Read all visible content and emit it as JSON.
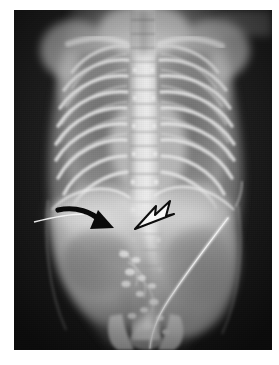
{
  "page": {
    "background_color": "#ffffff",
    "width": 279,
    "height": 365
  },
  "image": {
    "kind": "radiograph",
    "modality": "X-ray",
    "projection": "AP (anteroposterior)",
    "subject": "neonate / infant babygram",
    "region": "chest and abdomen",
    "orientation_note": "patient left on image right",
    "film": {
      "left": 14,
      "top": 10,
      "width": 258,
      "height": 340,
      "base_color": "#1d1d1d",
      "border_color": "#ffffff",
      "corner_patch": {
        "name": "bright-corner-patch",
        "position": "top-right",
        "color": "#6e6e6e"
      }
    },
    "tonal_range": {
      "darkest": "#141414",
      "soft_tissue": "#8d8d8d",
      "bone": "#d9d9d9",
      "brightest": "#f2f2f2"
    }
  },
  "anatomy": {
    "structures": [
      {
        "name": "cervical-spine",
        "label": "Cervical spine",
        "density": "bone"
      },
      {
        "name": "thoracic-spine",
        "label": "Thoracic spine",
        "density": "bone"
      },
      {
        "name": "lumbar-spine",
        "label": "Lumbar spine",
        "density": "bone"
      },
      {
        "name": "clavicle-left",
        "label": "Left clavicle",
        "density": "bone"
      },
      {
        "name": "clavicle-right",
        "label": "Right clavicle",
        "density": "bone"
      },
      {
        "name": "scapula-left",
        "label": "Left scapula",
        "density": "bone"
      },
      {
        "name": "scapula-right",
        "label": "Right scapula",
        "density": "bone"
      },
      {
        "name": "rib-cage",
        "label": "Rib cage",
        "density": "bone",
        "rib_pairs_visible": 9
      },
      {
        "name": "lung-field-right",
        "label": "Right lung field",
        "density": "air"
      },
      {
        "name": "lung-field-left",
        "label": "Left lung field",
        "density": "air"
      },
      {
        "name": "cardiac-silhouette",
        "label": "Cardiac silhouette",
        "density": "soft_tissue"
      },
      {
        "name": "diaphragm-right",
        "label": "Right hemidiaphragm",
        "density": "soft_tissue"
      },
      {
        "name": "diaphragm-left",
        "label": "Left hemidiaphragm",
        "density": "soft_tissue"
      },
      {
        "name": "liver-shadow",
        "label": "Liver",
        "density": "soft_tissue"
      },
      {
        "name": "stomach-gas-bubble",
        "label": "Gastric gas bubble",
        "density": "air"
      },
      {
        "name": "bowel-gas",
        "label": "Bowel gas pattern",
        "density": "air"
      },
      {
        "name": "pelvis",
        "label": "Pelvis",
        "density": "bone"
      },
      {
        "name": "umbilical-catheter",
        "label": "Umbilical catheter",
        "density": "metallic"
      }
    ]
  },
  "annotations": {
    "markers": [
      {
        "id": "solid-curved-arrow",
        "name": "solid-black-curved-arrow",
        "style": "solid filled curved arrow",
        "fill": "#000000",
        "points_toward": "right and slightly downward",
        "tip": {
          "x": 100,
          "y": 221
        },
        "tail": {
          "x": 40,
          "y": 214
        }
      },
      {
        "id": "open-arrowhead",
        "name": "open-outline-arrowhead",
        "style": "open outlined arrowhead",
        "fill": "#ffffff",
        "stroke": "#101010",
        "points_toward": "left and downward",
        "tip": {
          "x": 135,
          "y": 219
        },
        "tail": {
          "x": 168,
          "y": 201
        }
      }
    ]
  },
  "a11y": {
    "alt_text": "Anteroposterior chest and abdomen radiograph of an infant. A solid black curved arrow and an open outlined arrowhead mark findings in the upper abdomen below the diaphragm."
  }
}
